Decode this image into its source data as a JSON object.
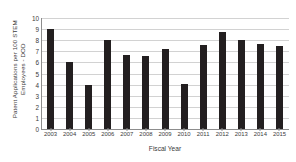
{
  "chart_data": {
    "type": "bar",
    "title": "",
    "xlabel": "Fiscal Year",
    "ylabel": "Patent Applications per 100 STEM Employees - DOD",
    "ylabel_lines": [
      "Patent Applications per 100 STEM",
      "Employees - DOD"
    ],
    "categories": [
      "2003",
      "2004",
      "2005",
      "2006",
      "2007",
      "2008",
      "2009",
      "2010",
      "2011",
      "2012",
      "2013",
      "2014",
      "2015"
    ],
    "values": [
      9.0,
      6.0,
      4.0,
      8.0,
      6.7,
      6.55,
      7.2,
      4.1,
      7.6,
      8.75,
      8.0,
      7.65,
      7.45
    ],
    "ylim": [
      0,
      10
    ],
    "ytick_labels": [
      "0",
      "1",
      "2",
      "3",
      "4",
      "5",
      "6",
      "7",
      "8",
      "9",
      "10"
    ],
    "ytick_values": [
      0,
      1,
      2,
      3,
      4,
      5,
      6,
      7,
      8,
      9,
      10
    ],
    "grid": true,
    "grid_axis": "y",
    "legend": false,
    "legend_position": "none",
    "bar_color": "#231f20",
    "grid_color": "#d2d2d2",
    "axis_color": "#8d8d8d",
    "text_color": "#3b3b3b",
    "background": "#ffffff"
  }
}
